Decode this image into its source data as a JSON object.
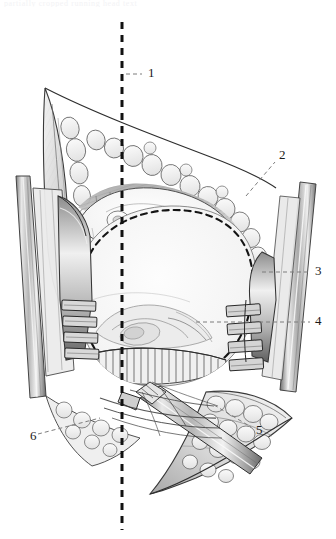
{
  "figure": {
    "kind": "anatomical-surgical-illustration",
    "medium": "graphite pencil line drawing, grayscale",
    "running_head": "partially cropped running head text",
    "background_color": "#ffffff",
    "ink_color": "#2b2b2b",
    "shade_light": "#e3e3e3",
    "shade_mid": "#bdbdbd",
    "shade_dark": "#8a8a8a",
    "shade_darkest": "#4a4a4a",
    "dashed_midline_color": "#111111",
    "leader_color": "#7d7d7d"
  },
  "labels": [
    {
      "id": "1",
      "text": "1",
      "x": 148,
      "y": 74,
      "leader": {
        "x1": 126,
        "y1": 74,
        "x2": 142,
        "y2": 74
      }
    },
    {
      "id": "2",
      "text": "2",
      "x": 279,
      "y": 156,
      "leader": {
        "x1": 246,
        "y1": 196,
        "x2": 275,
        "y2": 162
      }
    },
    {
      "id": "3",
      "text": "3",
      "x": 315,
      "y": 272,
      "leader": {
        "x1": 262,
        "y1": 272,
        "x2": 310,
        "y2": 272
      }
    },
    {
      "id": "4",
      "text": "4",
      "x": 315,
      "y": 322,
      "leader": {
        "x1": 196,
        "y1": 322,
        "x2": 310,
        "y2": 322
      }
    },
    {
      "id": "5",
      "text": "5",
      "x": 256,
      "y": 431,
      "leader": {
        "x1": 214,
        "y1": 405,
        "x2": 251,
        "y2": 427
      }
    },
    {
      "id": "6",
      "text": "6",
      "x": 30,
      "y": 437,
      "leader": {
        "x1": 38,
        "y1": 434,
        "x2": 100,
        "y2": 418
      }
    }
  ],
  "midline": {
    "name": "vertical-dashed-midline-axis",
    "x": 122,
    "y_top": 22,
    "y_bottom": 530,
    "dash_pattern": "7 6",
    "stroke_width": 3
  },
  "structures": [
    {
      "name": "skin-flap-upper-left",
      "description": "reflected triangular skin flap, upper left"
    },
    {
      "name": "skin-flap-lower-right",
      "description": "reflected skin flap margin, lower right"
    },
    {
      "name": "subcutaneous-fat-margin",
      "description": "lobulated fat globules lining the incision edge"
    },
    {
      "name": "dashed-oval-outline",
      "description": "dashed elliptical outline marking planned osteotomy / resection border"
    },
    {
      "name": "exposed-pale-surface",
      "description": "large pale exposed surface centre of field"
    },
    {
      "name": "left-retractor-blade",
      "description": "toothed self-retaining retractor blade, left"
    },
    {
      "name": "right-retractor-blade",
      "description": "toothed self-retaining retractor blade, right"
    },
    {
      "name": "left-retractor-shaft",
      "description": "long retractor shaft running up-left"
    },
    {
      "name": "right-retractor-shaft",
      "description": "long retractor shaft running up-right"
    },
    {
      "name": "surgical-elevator-instrument",
      "description": "handheld elevator/dissector entering from lower right"
    },
    {
      "name": "muscle-striation-band",
      "description": "hatched muscle fibre band along superior field"
    },
    {
      "name": "inferior-fibrous-fringe",
      "description": "fringed fibrous/periosteal edge at inferior margin"
    }
  ]
}
